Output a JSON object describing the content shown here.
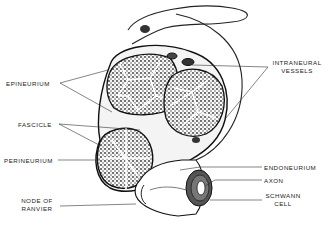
{
  "diagram": {
    "labels": {
      "epineurium": "EPINEURIUM",
      "intraneural_vessels_1": "INTRANEURAL",
      "intraneural_vessels_2": "VESSELS",
      "fascicle": "FASCICLE",
      "perineurium": "PERINEURIUM",
      "endoneurium": "ENDONEURIUM",
      "axon": "AXON",
      "schwann_1": "SCHWANN",
      "schwann_2": "CELL",
      "node_1": "NODE OF",
      "node_2": "RANVIER"
    },
    "signature": "JG"
  }
}
